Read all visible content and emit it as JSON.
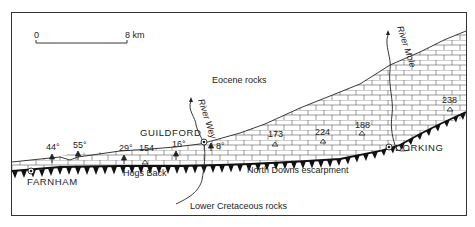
{
  "colors": {
    "ink": "#222222",
    "background": "#ffffff",
    "frame": "#333333"
  },
  "scale_bar": {
    "start_label": "0",
    "end_label": "8 km"
  },
  "rock_units": {
    "eocene": "Eocene rocks",
    "lower_cretaceous": "Lower Cretaceous rocks",
    "chalk_pattern": "brick-pattern-chalk"
  },
  "features": {
    "escarpment": "North Downs escarpment",
    "hogs_back": "Hogs Back"
  },
  "towns": [
    {
      "name": "FARNHAM"
    },
    {
      "name": "GUILDFORD"
    },
    {
      "name": "DORKING"
    }
  ],
  "rivers": [
    {
      "name": "River Wey"
    },
    {
      "name": "River Mole"
    }
  ],
  "dips": [
    {
      "value": "44°"
    },
    {
      "value": "55°"
    },
    {
      "value": "29°"
    },
    {
      "value": "16°"
    },
    {
      "value": "8°"
    }
  ],
  "spot_heights": [
    {
      "value": "154"
    },
    {
      "value": "173"
    },
    {
      "value": "224"
    },
    {
      "value": "188"
    },
    {
      "value": "238"
    }
  ]
}
